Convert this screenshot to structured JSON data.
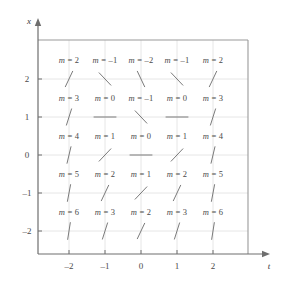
{
  "chart_data": {
    "type": "scatter",
    "title": "",
    "subtitle": "",
    "xlabel": "t",
    "ylabel": "x",
    "xlim": [
      -2.8,
      2.8
    ],
    "ylim": [
      -2.8,
      2.8
    ],
    "grid": true,
    "legend": null,
    "xticks": [
      -2,
      -1,
      0,
      1,
      2
    ],
    "xtick_labels": [
      "–2",
      "–1",
      "0",
      "1",
      "2"
    ],
    "yticks": [
      -2,
      -1,
      0,
      1,
      2
    ],
    "ytick_labels": [
      "–2",
      "–1",
      "0",
      "1",
      "2"
    ],
    "slope_relation": "m = t^2 + x - 2",
    "points": [
      {
        "t": -2,
        "x": 2,
        "m": 2,
        "label": "m = 2"
      },
      {
        "t": -1,
        "x": 2,
        "m": -1,
        "label": "m = –1"
      },
      {
        "t": 0,
        "x": 2,
        "m": -2,
        "label": "m = –2"
      },
      {
        "t": 1,
        "x": 2,
        "m": -1,
        "label": "m = –1"
      },
      {
        "t": 2,
        "x": 2,
        "m": 2,
        "label": "m = 2"
      },
      {
        "t": -2,
        "x": 1,
        "m": 3,
        "label": "m = 3"
      },
      {
        "t": -1,
        "x": 1,
        "m": 0,
        "label": "m = 0"
      },
      {
        "t": 0,
        "x": 1,
        "m": -1,
        "label": "m = –1"
      },
      {
        "t": 1,
        "x": 1,
        "m": 0,
        "label": "m = 0"
      },
      {
        "t": 2,
        "x": 1,
        "m": 3,
        "label": "m = 3"
      },
      {
        "t": -2,
        "x": 0,
        "m": 4,
        "label": "m = 4"
      },
      {
        "t": -1,
        "x": 0,
        "m": 1,
        "label": "m = 1"
      },
      {
        "t": 0,
        "x": 0,
        "m": 0,
        "label": "m = 0"
      },
      {
        "t": 1,
        "x": 0,
        "m": 1,
        "label": "m = 1"
      },
      {
        "t": 2,
        "x": 0,
        "m": 4,
        "label": "m = 4"
      },
      {
        "t": -2,
        "x": -1,
        "m": 5,
        "label": "m = 5"
      },
      {
        "t": -1,
        "x": -1,
        "m": 2,
        "label": "m = 2"
      },
      {
        "t": 0,
        "x": -1,
        "m": 1,
        "label": "m = 1"
      },
      {
        "t": 1,
        "x": -1,
        "m": 2,
        "label": "m = 2"
      },
      {
        "t": 2,
        "x": -1,
        "m": 5,
        "label": "m = 5"
      },
      {
        "t": -2,
        "x": -2,
        "m": 6,
        "label": "m = 6"
      },
      {
        "t": -1,
        "x": -2,
        "m": 3,
        "label": "m = 3"
      },
      {
        "t": 0,
        "x": -2,
        "m": 2,
        "label": "m = 2"
      },
      {
        "t": 1,
        "x": -2,
        "m": 3,
        "label": "m = 3"
      },
      {
        "t": 2,
        "x": -2,
        "m": 6,
        "label": "m = 6"
      }
    ]
  },
  "style": {
    "axis_color": "#6e6e6e",
    "frame_color": "#9a9a9a",
    "grid_color": "#e6e6e6",
    "segment_color": "#7a7a7a",
    "text_color": "#4a4a4a",
    "background": "#ffffff"
  }
}
